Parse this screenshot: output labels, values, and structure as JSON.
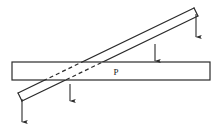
{
  "figure": {
    "background_color": "#ffffff",
    "line_color": "#2b2b2b",
    "dashed_line_color": "#2b2b2b",
    "label_color": "#1a1a1a"
  },
  "labels": {
    "point_p": "P"
  },
  "horizontal_beam": {
    "name": "horizontal-beam",
    "x": 12,
    "y": 62,
    "width": 198,
    "height": 18,
    "fill": "#ffffff",
    "stroke": "#2b2b2b",
    "stroke_width": 1.2
  },
  "inclined_bar": {
    "name": "inclined-bar",
    "left_end_x": 20,
    "left_end_y": 97,
    "right_end_x": 196,
    "right_end_y": 12,
    "thickness": 9,
    "stroke": "#2b2b2b",
    "stroke_width": 1.2,
    "hidden_segment_dash": "4,3"
  },
  "arrows": [
    {
      "name": "load-arrow-left-end",
      "x": 22,
      "y_start": 99,
      "y_end": 122,
      "label": ""
    },
    {
      "name": "load-arrow-inner-left",
      "x": 70,
      "y_start": 84,
      "y_end": 101,
      "label": ""
    },
    {
      "name": "load-arrow-inner-right",
      "x": 155,
      "y_start": 44,
      "y_end": 61,
      "label": ""
    },
    {
      "name": "load-arrow-right-end",
      "x": 196,
      "y_start": 14,
      "y_end": 37,
      "label": ""
    }
  ],
  "point_marker": {
    "name": "contact-point-p",
    "x": 116,
    "y": 75
  }
}
